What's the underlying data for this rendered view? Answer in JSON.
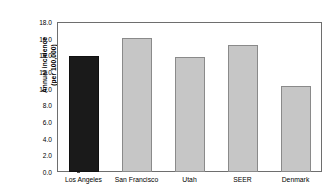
{
  "chart_data": {
    "type": "bar",
    "title": "",
    "xlabel": "",
    "ylabel": "Annual incidence (per 100,000)",
    "ylabel_line1": "Annual incidence",
    "ylabel_line2": "(per 100,000)",
    "categories": [
      "Los Angeles",
      "San Francisco",
      "Utah",
      "SEER",
      "Denmark"
    ],
    "values": [
      13.9,
      16.1,
      13.8,
      15.3,
      10.3
    ],
    "ylim": [
      0.0,
      18.0
    ],
    "ytick_step": 2.0,
    "ytick_labels": [
      "18.0",
      "16.0",
      "14.0",
      "12.0",
      "10.0",
      "8.0",
      "6.0",
      "4.0",
      "2.0",
      "0.0"
    ],
    "ytick_values": [
      18.0,
      16.0,
      14.0,
      12.0,
      10.0,
      8.0,
      6.0,
      4.0,
      2.0,
      0.0
    ],
    "grid": false,
    "legend": false,
    "bar_colors": [
      "#1a1a1a",
      "#c6c6c6",
      "#c6c6c6",
      "#c6c6c6",
      "#c6c6c6"
    ],
    "bar_border_colors": [
      "#101010",
      "#8a8a8a",
      "#8a8a8a",
      "#8a8a8a",
      "#8a8a8a"
    ],
    "highlight_category": "Los Angeles",
    "frame_color": "#6e6e6e",
    "background_color": "#ffffff"
  }
}
